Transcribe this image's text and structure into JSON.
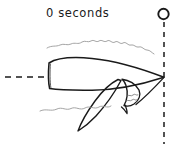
{
  "figure": {
    "title_label": "0 seconds",
    "style": "hand-drawn sketch",
    "background_color": "#ffffff",
    "ink_color": "#1a1a1a",
    "light_ink_color": "#8a8a8a"
  },
  "annotations": {
    "time_label": "0 seconds",
    "marker_icon": "circle-marker-icon",
    "vertical_reference_icon": "dashed-vertical-line-icon",
    "horizontal_reference_icon": "dashed-horizontal-line-icon"
  },
  "drawing": {
    "subject": "whale-body-icon",
    "flipper": "whale-flipper-icon",
    "fin": "whale-fin-icon",
    "upper_water_line": "water-wave-line-icon",
    "lower_water_line": "water-wave-line-icon"
  },
  "geometry": {
    "marker_circle": {
      "cx": 163,
      "cy": 14,
      "r": 5
    },
    "vertical_dashed_line": {
      "x": 164,
      "y_start": 22,
      "y_end": 144
    },
    "horizontal_dashed_line": {
      "y": 77,
      "x_start": 5,
      "x_end": 48
    },
    "body_tip": {
      "x": 164,
      "y": 77
    },
    "flipper_tip": {
      "x": 78,
      "y": 131
    }
  }
}
